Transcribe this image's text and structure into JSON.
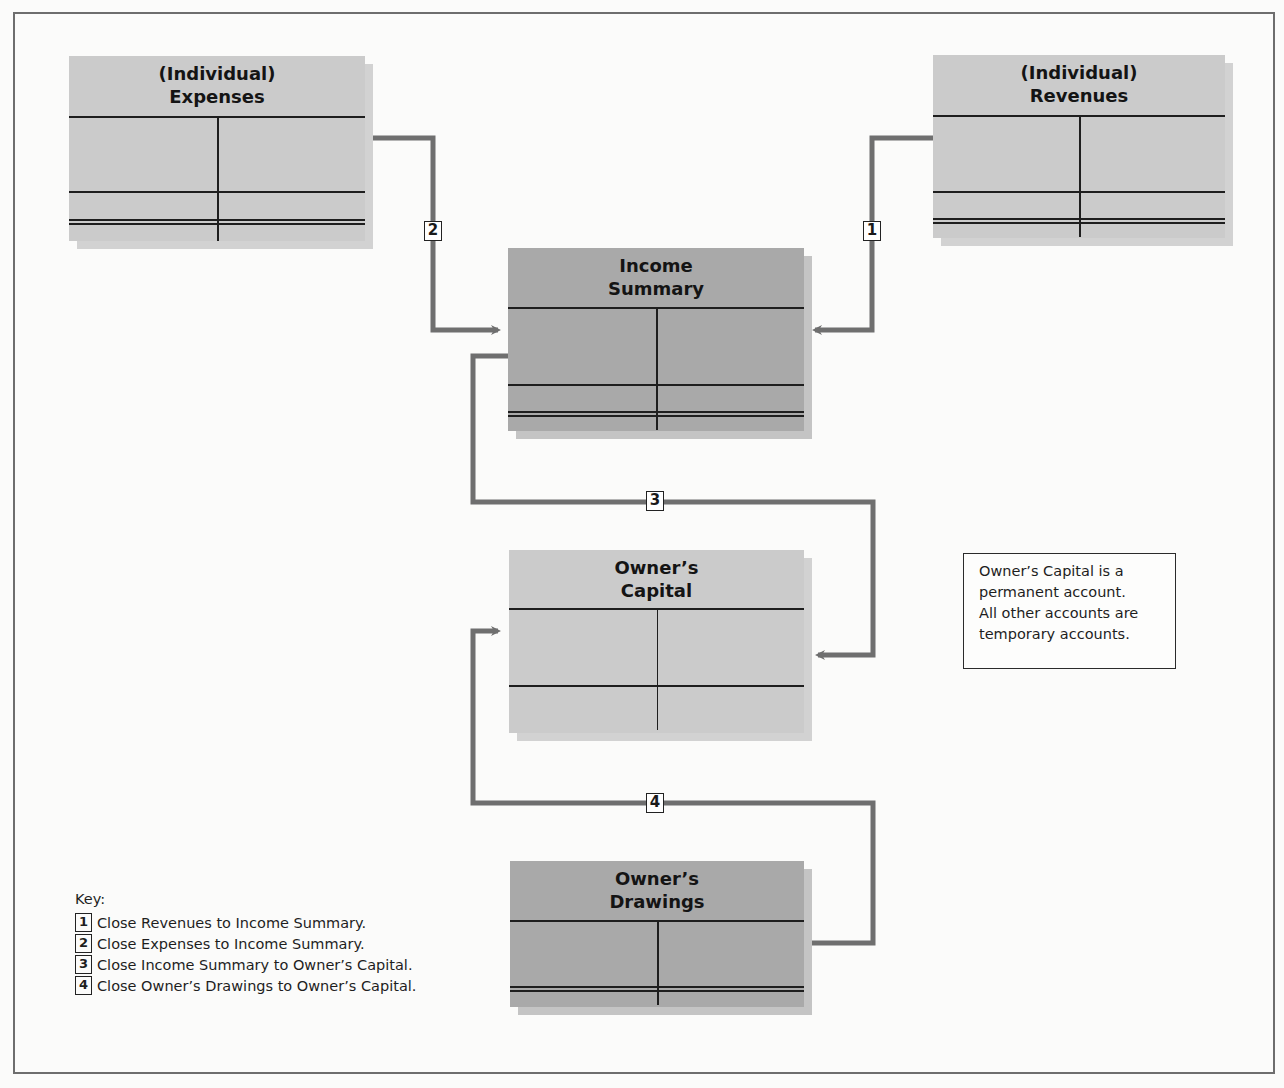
{
  "diagram": {
    "accounts": {
      "expenses": {
        "line1": "(Individual)",
        "line2": "Expenses",
        "type": "temporary"
      },
      "revenues": {
        "line1": "(Individual)",
        "line2": "Revenues",
        "type": "temporary"
      },
      "income_summary": {
        "line1": "Income",
        "line2": "Summary",
        "type": "temporary"
      },
      "owners_capital": {
        "line1": "Owner’s",
        "line2": "Capital",
        "type": "permanent"
      },
      "owners_drawings": {
        "line1": "Owner’s",
        "line2": "Drawings",
        "type": "temporary"
      }
    },
    "connectors": [
      {
        "step": "1",
        "from": "Revenues",
        "to": "Income Summary"
      },
      {
        "step": "2",
        "from": "Expenses",
        "to": "Income Summary"
      },
      {
        "step": "3",
        "from": "Income Summary",
        "to": "Owner’s Capital"
      },
      {
        "step": "4",
        "from": "Owner’s Drawings",
        "to": "Owner’s Capital"
      }
    ],
    "note": {
      "lines": [
        "Owner’s Capital is a",
        "permanent account.",
        "All other accounts are",
        "temporary accounts."
      ]
    },
    "key": {
      "title": "Key:",
      "items": [
        {
          "num": "1",
          "text": "Close Revenues to Income Summary."
        },
        {
          "num": "2",
          "text": "Close Expenses to Income Summary."
        },
        {
          "num": "3",
          "text": "Close Income Summary to Owner’s Capital."
        },
        {
          "num": "4",
          "text": "Close Owner’s Drawings to Owner’s Capital."
        }
      ]
    },
    "colors": {
      "light_account": "#cbcbcb",
      "dark_account": "#a9a9a9",
      "connector": "#6f6f6f",
      "rule": "#1e1e1e"
    }
  }
}
